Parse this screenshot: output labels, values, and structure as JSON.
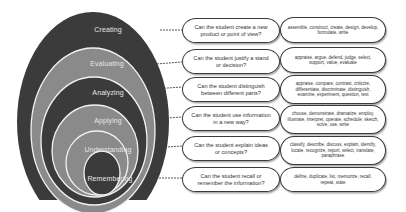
{
  "diagram": {
    "levels": [
      {
        "name": "Creating",
        "question": "Can the student create a new product or point of view?",
        "verbs": "assemble, construct, create, design, develop, formulate, write"
      },
      {
        "name": "Evaluating",
        "question": "Can the student justify a stand or decision?",
        "verbs": "appraise, argue, defend, judge, select, support, value, evaluate"
      },
      {
        "name": "Analyzing",
        "question": "Can the student distinguish between different parts?",
        "verbs": "appraise, compare, contrast, criticize, differentiate, discriminate, distinguish, examine, experiment, question, test"
      },
      {
        "name": "Applying",
        "question": "Can the student use information in a new way?",
        "verbs": "choose, demonstrate, dramatize, employ, illustrate, interpret, operate, schedule, sketch, solve, use, write"
      },
      {
        "name": "Understanding",
        "question": "Can the student explain ideas or concepts?",
        "verbs": "classify, describe, discuss, explain, identify, locate, recognize, report, select, translate, paraphrase"
      },
      {
        "name": "Remembering",
        "question": "Can the student recall or remember the information?",
        "verbs": "define, duplicate, list, memorize, recall, repeat, state"
      }
    ],
    "colors": {
      "dark_ring": "#3b3b3b",
      "light_ring": "#8a8a8a",
      "ring_outline": "#f2f2f2",
      "connector": "#555555",
      "bubble_border": "#3a3a3a"
    }
  }
}
